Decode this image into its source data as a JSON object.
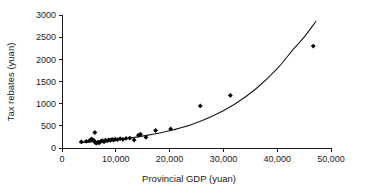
{
  "chart_data": {
    "type": "scatter",
    "title": "",
    "xlabel": "Provincial GDP (yuan)",
    "ylabel": "Tax rebates (yuan)",
    "xlim": [
      0,
      50000
    ],
    "ylim": [
      0,
      3000
    ],
    "xticks": [
      0,
      10000,
      20000,
      30000,
      40000,
      50000
    ],
    "xtick_labels": [
      "0",
      "10,000",
      "20,000",
      "30,000",
      "40,000",
      "50,000"
    ],
    "yticks": [
      0,
      500,
      1000,
      1500,
      2000,
      2500,
      3000
    ],
    "ytick_labels": [
      "0",
      "500",
      "1000",
      "1500",
      "2000",
      "2500",
      "3000"
    ],
    "grid": false,
    "legend": null,
    "marker": "diamond",
    "marker_color": "#050505",
    "curve_color": "#1a1a1a",
    "axis_color": "#1a1a1a",
    "points": [
      [
        3600,
        140
      ],
      [
        4500,
        150
      ],
      [
        5100,
        165
      ],
      [
        5500,
        205
      ],
      [
        5900,
        175
      ],
      [
        6100,
        350
      ],
      [
        6200,
        120
      ],
      [
        6400,
        110
      ],
      [
        6700,
        130
      ],
      [
        6900,
        115
      ],
      [
        7200,
        150
      ],
      [
        7500,
        165
      ],
      [
        7800,
        140
      ],
      [
        8100,
        175
      ],
      [
        8400,
        160
      ],
      [
        8700,
        185
      ],
      [
        9000,
        170
      ],
      [
        9300,
        195
      ],
      [
        9600,
        180
      ],
      [
        9900,
        200
      ],
      [
        10300,
        190
      ],
      [
        10800,
        210
      ],
      [
        11300,
        195
      ],
      [
        11900,
        215
      ],
      [
        12600,
        225
      ],
      [
        13400,
        180
      ],
      [
        14200,
        290
      ],
      [
        14600,
        310
      ],
      [
        15600,
        240
      ],
      [
        17400,
        395
      ],
      [
        20200,
        430
      ],
      [
        25700,
        950
      ],
      [
        31300,
        1185
      ],
      [
        46700,
        2300
      ]
    ],
    "fit_curve": {
      "description": "exponential trend line",
      "x_start": 3300,
      "x_end": 47200,
      "y_start": 120,
      "y_end": 2860,
      "samples": [
        [
          3300,
          120
        ],
        [
          8000,
          160
        ],
        [
          12000,
          215
        ],
        [
          16000,
          290
        ],
        [
          20000,
          390
        ],
        [
          24000,
          525
        ],
        [
          28000,
          720
        ],
        [
          32000,
          980
        ],
        [
          36000,
          1330
        ],
        [
          40000,
          1790
        ],
        [
          43000,
          2230
        ],
        [
          45000,
          2500
        ],
        [
          47200,
          2860
        ]
      ]
    }
  },
  "axes": {
    "x_title": "Provincial GDP (yuan)",
    "y_title": "Tax rebates (yuan)"
  }
}
